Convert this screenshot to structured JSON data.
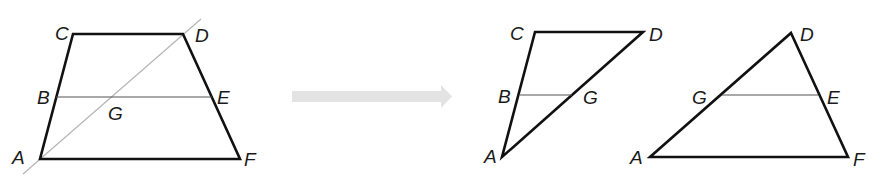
{
  "figure": {
    "trapezoid": {
      "labels": {
        "A": "A",
        "B": "B",
        "C": "C",
        "D": "D",
        "E": "E",
        "F": "F",
        "G": "G"
      }
    },
    "arrow": {
      "color": "#e3e3e3",
      "direction": "right"
    },
    "triangle_acd": {
      "labels": {
        "A": "A",
        "B": "B",
        "C": "C",
        "D": "D",
        "G": "G"
      }
    },
    "triangle_adf": {
      "labels": {
        "A": "A",
        "D": "D",
        "E": "E",
        "F": "F",
        "G": "G"
      }
    },
    "colors": {
      "edge": "#111111",
      "midline": "#555555",
      "diagonal": "#b5b5b5"
    }
  }
}
